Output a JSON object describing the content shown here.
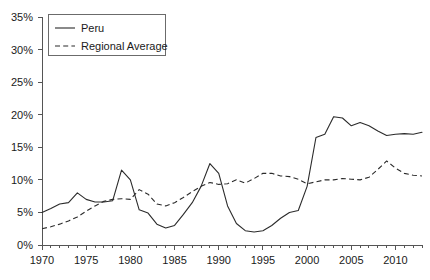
{
  "chart_data": {
    "type": "line",
    "title": "",
    "subtitle": "",
    "xlabel": "",
    "ylabel": "",
    "xlim": [
      1970,
      2013
    ],
    "ylim": [
      0,
      35
    ],
    "grid": false,
    "legend_position": "top-left",
    "y_ticks": [
      0,
      5,
      10,
      15,
      20,
      25,
      30,
      35
    ],
    "y_tick_labels": [
      "0%",
      "5%",
      "10%",
      "15%",
      "20%",
      "25%",
      "30%",
      "35%"
    ],
    "x_ticks": [
      1970,
      1975,
      1980,
      1985,
      1990,
      1995,
      2000,
      2005,
      2010
    ],
    "x_tick_labels": [
      "1970",
      "1975",
      "1980",
      "1985",
      "1990",
      "1995",
      "2000",
      "2005",
      "2010"
    ],
    "x_minor_tick_step": 1,
    "x": [
      1970,
      1971,
      1972,
      1973,
      1974,
      1975,
      1976,
      1977,
      1978,
      1979,
      1980,
      1981,
      1982,
      1983,
      1984,
      1985,
      1986,
      1987,
      1988,
      1989,
      1990,
      1991,
      1992,
      1993,
      1994,
      1995,
      1996,
      1997,
      1998,
      1999,
      2000,
      2001,
      2002,
      2003,
      2004,
      2005,
      2006,
      2007,
      2008,
      2009,
      2010,
      2011,
      2012,
      2013
    ],
    "series": [
      {
        "name": "Peru",
        "style": "solid",
        "color": "#2b2b2b",
        "values": [
          5.0,
          5.6,
          6.3,
          6.5,
          8.0,
          7.0,
          6.6,
          6.6,
          6.8,
          11.5,
          10.0,
          5.4,
          4.9,
          3.2,
          2.6,
          3.0,
          4.7,
          6.5,
          9.0,
          12.5,
          11.0,
          6.0,
          3.3,
          2.2,
          2.0,
          2.2,
          3.0,
          4.1,
          5.0,
          5.3,
          9.0,
          16.5,
          17.0,
          19.7,
          19.5,
          18.3,
          18.8,
          18.3,
          17.5,
          16.8,
          17.0,
          17.1,
          17.0,
          17.3
        ]
      },
      {
        "name": "Regional Average",
        "style": "dashed",
        "color": "#2b2b2b",
        "values": [
          2.5,
          2.8,
          3.2,
          3.7,
          4.3,
          5.2,
          6.0,
          6.7,
          7.0,
          7.1,
          7.0,
          8.5,
          7.8,
          6.3,
          6.0,
          6.5,
          7.3,
          8.2,
          9.0,
          9.6,
          9.3,
          9.4,
          10.0,
          9.5,
          10.2,
          11.0,
          11.0,
          10.6,
          10.5,
          10.1,
          9.4,
          9.7,
          10.0,
          10.0,
          10.2,
          10.1,
          10.0,
          10.4,
          11.6,
          12.9,
          11.8,
          11.0,
          10.7,
          10.6
        ]
      }
    ]
  },
  "legend": {
    "entries": [
      {
        "label": "Peru",
        "style": "solid"
      },
      {
        "label": "Regional Average",
        "style": "dashed"
      }
    ]
  }
}
